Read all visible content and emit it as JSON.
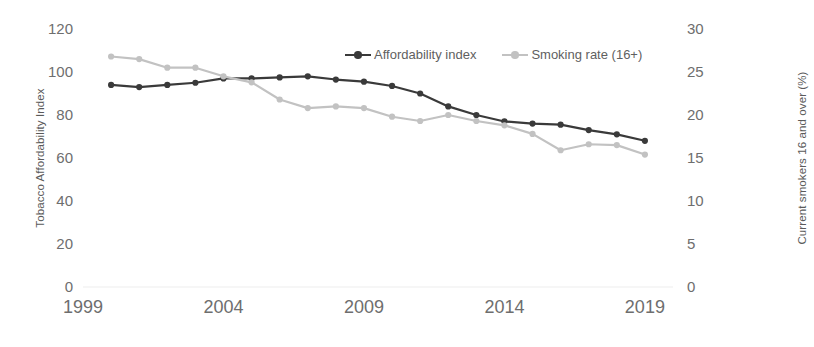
{
  "chart_data": {
    "type": "line",
    "title": "",
    "xlabel": "",
    "ylabel": "Tobacco Affordability Index",
    "y2label": "Current smokers 16 and over (%)",
    "grid": false,
    "legend_position": "top-center",
    "xlim": [
      1999,
      2020
    ],
    "ylim": [
      0,
      120
    ],
    "y2lim": [
      0,
      30
    ],
    "xticks": [
      "1999",
      "2004",
      "2009",
      "2014",
      "2019"
    ],
    "xtick_values": [
      1999,
      2004,
      2009,
      2014,
      2019
    ],
    "yticks": [
      "0",
      "20",
      "40",
      "60",
      "80",
      "100",
      "120"
    ],
    "ytick_values": [
      0,
      20,
      40,
      60,
      80,
      100,
      120
    ],
    "y2ticks": [
      "0",
      "5",
      "10",
      "15",
      "20",
      "25",
      "30"
    ],
    "y2tick_values": [
      0,
      5,
      10,
      15,
      20,
      25,
      30
    ],
    "x": [
      2000,
      2001,
      2002,
      2003,
      2004,
      2005,
      2006,
      2007,
      2008,
      2009,
      2010,
      2011,
      2012,
      2013,
      2014,
      2015,
      2016,
      2017,
      2018,
      2019
    ],
    "series": [
      {
        "name": "Affordability index",
        "axis": "left",
        "color": "#3a3a3a",
        "marker": "circle",
        "values": [
          94,
          93,
          94,
          95,
          97,
          97,
          97.5,
          98,
          96.5,
          95.5,
          93.5,
          90,
          84,
          80,
          77,
          76,
          75.5,
          73,
          71,
          68
        ]
      },
      {
        "name": "Smoking rate (16+)",
        "axis": "right",
        "color": "#c2c2c2",
        "marker": "circle",
        "values": [
          26.8,
          26.5,
          25.5,
          25.5,
          24.5,
          23.8,
          21.8,
          20.8,
          21,
          20.8,
          19.8,
          19.3,
          20,
          19.3,
          18.8,
          17.8,
          15.9,
          16.6,
          16.5,
          15.4
        ]
      }
    ]
  }
}
